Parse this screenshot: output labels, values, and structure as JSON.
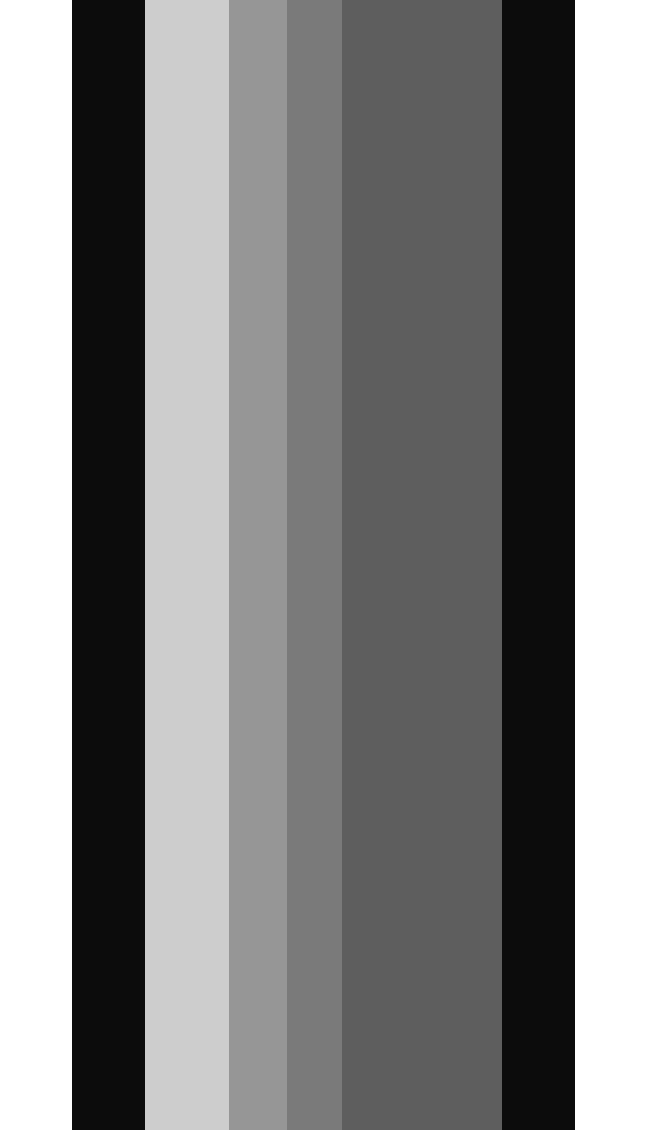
{
  "image": {
    "description": "Vertical grayscale stripes",
    "background": "#ffffff",
    "stripes": [
      {
        "name": "black-left",
        "x": 72,
        "width": 73,
        "color": "#0c0c0c"
      },
      {
        "name": "light-gray",
        "x": 145,
        "width": 84,
        "color": "#cdcdcd"
      },
      {
        "name": "mid-gray",
        "x": 229,
        "width": 58,
        "color": "#969696"
      },
      {
        "name": "gray",
        "x": 287,
        "width": 55,
        "color": "#7a7a7a"
      },
      {
        "name": "dark-gray",
        "x": 342,
        "width": 160,
        "color": "#5e5e5e"
      },
      {
        "name": "black-right",
        "x": 502,
        "width": 73,
        "color": "#0c0c0c"
      }
    ]
  }
}
